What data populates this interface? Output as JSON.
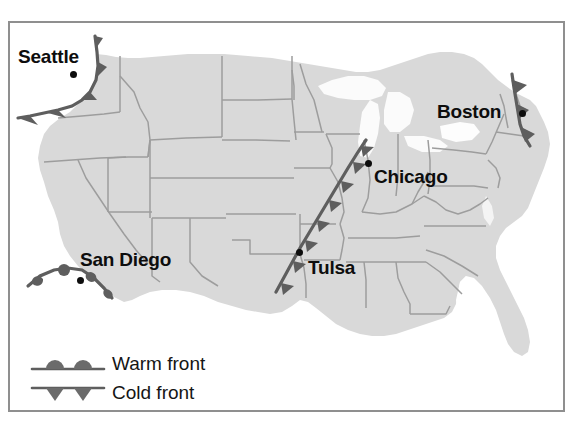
{
  "figure": {
    "type": "weather-map",
    "region": "Contiguous United States",
    "frame_color": "#8f8f8f",
    "land_color": "#d9d9d9",
    "border_color": "#9a9a9a",
    "water_color": "#ffffff",
    "front_color": "#5e5e5e",
    "label_color": "#0d0d0d"
  },
  "cities": [
    {
      "name": "Seattle",
      "label_x": 18,
      "label_y": 47,
      "dot_x": 70,
      "dot_y": 71
    },
    {
      "name": "Boston",
      "label_x": 437,
      "label_y": 102,
      "dot_x": 519,
      "dot_y": 110
    },
    {
      "name": "Chicago",
      "label_x": 374,
      "label_y": 167,
      "dot_x": 365,
      "dot_y": 160
    },
    {
      "name": "San Diego",
      "label_x": 80,
      "label_y": 250,
      "dot_x": 77,
      "dot_y": 277
    },
    {
      "name": "Tulsa",
      "label_x": 308,
      "label_y": 258,
      "dot_x": 298,
      "dot_y": 251
    }
  ],
  "fronts": [
    {
      "id": "seattle-front",
      "kind": "cold",
      "near_city": "Seattle",
      "barb_side": "left"
    },
    {
      "id": "boston-front",
      "kind": "cold",
      "near_city": "Boston",
      "barb_side": "right"
    },
    {
      "id": "plains-front",
      "kind": "cold",
      "near_city": "Tulsa-Chicago",
      "barb_side": "right"
    },
    {
      "id": "sandiego-front",
      "kind": "warm",
      "near_city": "San Diego",
      "barb_side": "below"
    }
  ],
  "legend": {
    "items": [
      {
        "symbol": "warm-front-symbol",
        "label": "Warm front"
      },
      {
        "symbol": "cold-front-symbol",
        "label": "Cold front"
      }
    ]
  }
}
